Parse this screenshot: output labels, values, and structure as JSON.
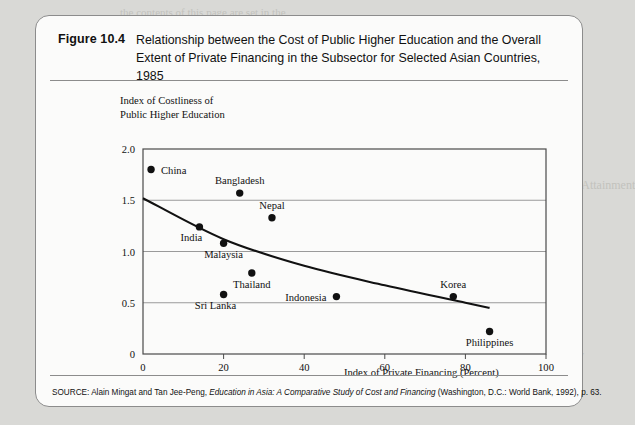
{
  "figure": {
    "number": "Figure 10.4",
    "title_line1": "Relationship between the Cost of Public Higher Education and the Overall",
    "title_line2": "Extent of Private Financing in the Subsector for Selected Asian Countries, 1985",
    "source_prefix": "SOURCE: Alain Mingat and Tan Jee-Peng, ",
    "source_italic": "Education in Asia: A Comparative Study of Cost and Financing",
    "source_suffix": " (Washington, D.C.: World Bank, 1992), p. 63."
  },
  "ghost_text": [
    {
      "text": "the contents of this page are set in the",
      "x": 120,
      "y": 6,
      "size": 11
    },
    {
      "text": "10.3  Gender Disparities in Educational Attainment",
      "x": 392,
      "y": 178,
      "size": 12
    },
    {
      "text": "participation in schooling",
      "x": 395,
      "y": 205,
      "size": 11
    },
    {
      "text": "enrollment ratios remain",
      "x": 398,
      "y": 222,
      "size": 11
    },
    {
      "text": "and in many countries",
      "x": 400,
      "y": 239,
      "size": 11
    },
    {
      "text": "Table 10.1 presents the",
      "x": 398,
      "y": 256,
      "size": 11
    },
    {
      "text": "10.4  General Issues in Education Policy",
      "x": 392,
      "y": 348,
      "size": 12
    }
  ],
  "chart_data": {
    "type": "scatter",
    "title": "Relationship between the Cost of Public Higher Education and the Overall Extent of Private Financing in the Subsector for Selected Asian Countries, 1985",
    "xlabel": "Index of Private Financing (Percent)",
    "ylabel_line1": "Index of Costliness of",
    "ylabel_line2": "Public Higher Education",
    "xlim": [
      0,
      100
    ],
    "ylim": [
      0,
      2.0
    ],
    "xticks": [
      "0",
      "20",
      "40",
      "60",
      "80",
      "100"
    ],
    "xtick_values": [
      0,
      20,
      40,
      60,
      80,
      100
    ],
    "yticks": [
      "0",
      "0.5",
      "1.0",
      "1.5",
      "2.0"
    ],
    "ytick_values": [
      0,
      0.5,
      1.0,
      1.5,
      2.0
    ],
    "grid": "horizontal",
    "legend": "none",
    "points": [
      {
        "label": "China",
        "x": 2,
        "y": 1.8,
        "label_pos": "right"
      },
      {
        "label": "Bangladesh",
        "x": 24,
        "y": 1.57,
        "label_pos": "above"
      },
      {
        "label": "Nepal",
        "x": 32,
        "y": 1.33,
        "label_pos": "above"
      },
      {
        "label": "India",
        "x": 14,
        "y": 1.24,
        "label_pos": "below-left"
      },
      {
        "label": "Malaysia",
        "x": 20,
        "y": 1.08,
        "label_pos": "below"
      },
      {
        "label": "Thailand",
        "x": 27,
        "y": 0.79,
        "label_pos": "below"
      },
      {
        "label": "Sri Lanka",
        "x": 20,
        "y": 0.58,
        "label_pos": "below-left"
      },
      {
        "label": "Indonesia",
        "x": 48,
        "y": 0.56,
        "label_pos": "left"
      },
      {
        "label": "Korea",
        "x": 77,
        "y": 0.56,
        "label_pos": "above"
      },
      {
        "label": "Philippines",
        "x": 86,
        "y": 0.22,
        "label_pos": "below"
      }
    ],
    "trend_curve": {
      "description": "fitted declining curve",
      "points": [
        {
          "x": 0,
          "y": 1.52
        },
        {
          "x": 20,
          "y": 1.12
        },
        {
          "x": 40,
          "y": 0.86
        },
        {
          "x": 60,
          "y": 0.67
        },
        {
          "x": 80,
          "y": 0.5
        },
        {
          "x": 86,
          "y": 0.45
        }
      ]
    }
  }
}
